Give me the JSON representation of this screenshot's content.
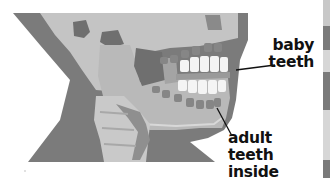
{
  "diagram": {
    "labels": [
      {
        "id": "baby",
        "line1": "baby",
        "line2": "teeth"
      },
      {
        "id": "adult",
        "line1": "adult teeth",
        "line2": "inside gums"
      }
    ]
  },
  "colors": {
    "neck": "#7b7b7b",
    "skull": "#b9b9b9",
    "skull_light": "#cbcbcb",
    "dark_cavity": "#6f6f6f",
    "teeth": "#f4f4f4",
    "text": "#111111"
  },
  "edge_strip": {
    "bands": [
      "#c8c8c8",
      "#7a7a7a",
      "#d6d6d6",
      "#7a7a7a",
      "#d6d6d6",
      "#7a7a7a"
    ]
  }
}
